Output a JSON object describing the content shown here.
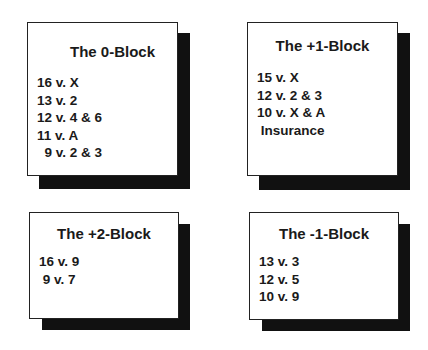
{
  "blocks": [
    {
      "title": "The 0-Block",
      "lines": [
        "16 v. X",
        "13 v. 2",
        "12 v. 4 & 6",
        "11 v. A",
        "  9 v. 2 & 3"
      ]
    },
    {
      "title": "The +1-Block",
      "lines": [
        "15 v. X",
        "12 v. 2 & 3",
        "10 v. X & A",
        " Insurance"
      ]
    },
    {
      "title": "The +2-Block",
      "lines": [
        "16 v. 9",
        " 9 v. 7"
      ]
    },
    {
      "title": "The -1-Block",
      "lines": [
        "13 v. 3",
        "12 v. 5",
        "10 v. 9"
      ]
    }
  ],
  "colors": {
    "shadow": "#111111",
    "border": "#222222",
    "text": "#1a1a1a",
    "card": "#ffffff"
  }
}
